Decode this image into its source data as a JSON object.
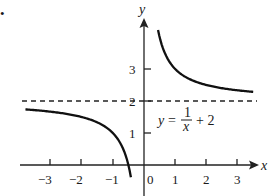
{
  "chart_data": {
    "type": "line",
    "title": "",
    "function": "y = 1/x + 2",
    "xlabel": "x",
    "ylabel": "y",
    "xlim": [
      -3.9,
      3.6
    ],
    "ylim": [
      -0.9,
      4.8
    ],
    "grid": false,
    "x_ticks": [
      -3,
      -2,
      -1,
      0,
      1,
      2,
      3
    ],
    "x_tick_labels": [
      "−3",
      "−2",
      "−1",
      "0",
      "1",
      "2",
      "3"
    ],
    "y_ticks": [
      1,
      2,
      3
    ],
    "y_tick_labels": [
      "1",
      "2",
      "3"
    ],
    "asymptotes": [
      {
        "type": "horizontal",
        "y": 2,
        "style": "dashed",
        "label": "2"
      },
      {
        "type": "vertical",
        "x": 0,
        "style": "axis"
      }
    ],
    "series": [
      {
        "name": "left branch",
        "x": [
          -3.8,
          -3,
          -2,
          -1.5,
          -1,
          -0.8,
          -0.6,
          -0.5,
          -0.45
        ],
        "values": [
          1.74,
          1.67,
          1.5,
          1.33,
          1.0,
          0.75,
          0.33,
          0.0,
          -0.22
        ]
      },
      {
        "name": "right branch",
        "x": [
          0.45,
          0.6,
          0.8,
          1,
          1.5,
          2,
          2.5,
          3,
          3.5
        ],
        "values": [
          4.22,
          3.67,
          3.25,
          3.0,
          2.67,
          2.5,
          2.4,
          2.33,
          2.29
        ]
      }
    ],
    "annotations": [
      {
        "text": "y = 1/x + 2",
        "x": 1.5,
        "y": 1.4
      }
    ]
  },
  "labels": {
    "x_axis": "x",
    "y_axis": "y",
    "equation_lhs": "y",
    "equation_eq": "=",
    "equation_num": "1",
    "equation_den": "x",
    "equation_rhs": "+ 2",
    "bullet": "•"
  }
}
